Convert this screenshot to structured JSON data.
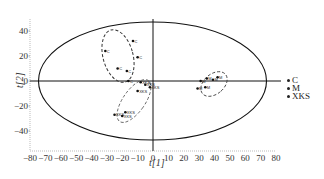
{
  "chart_data": {
    "type": "scatter",
    "title": "",
    "xlabel": "t[1]",
    "ylabel": "t[2]",
    "xlim": [
      -80,
      80
    ],
    "ylim": [
      -50,
      50
    ],
    "x_ticks": [
      -80,
      -70,
      -60,
      -50,
      -40,
      -30,
      -20,
      -10,
      0,
      10,
      20,
      30,
      40,
      50,
      60,
      70,
      80
    ],
    "y_ticks": [
      40,
      20,
      0,
      -20,
      -40
    ],
    "grid": false,
    "legend_position": "right",
    "hotelling_ellipse": {
      "cx": 0,
      "cy": 0,
      "rx": 74,
      "ry": 47
    },
    "series": [
      {
        "name": "C",
        "label": "C",
        "points": [
          [
            -13,
            32
          ],
          [
            -31,
            24
          ],
          [
            -10,
            19
          ],
          [
            -23,
            10
          ],
          [
            -17,
            8
          ],
          [
            -16,
            0
          ]
        ]
      },
      {
        "name": "M",
        "label": "M",
        "points": [
          [
            42,
            3
          ],
          [
            35,
            2
          ],
          [
            39,
            1
          ],
          [
            31,
            0
          ],
          [
            34,
            -5
          ],
          [
            29,
            -6
          ]
        ]
      },
      {
        "name": "XKS",
        "label": "XKS",
        "points": [
          [
            -8,
            -1
          ],
          [
            -5,
            -3
          ],
          [
            -2,
            -5
          ],
          [
            -10,
            -8
          ],
          [
            -18,
            -25
          ],
          [
            -25,
            -27
          ],
          [
            -20,
            -28
          ]
        ]
      }
    ],
    "group_ellipses": [
      {
        "group": "C",
        "style": "dashed"
      },
      {
        "group": "M",
        "style": "dashed"
      },
      {
        "group": "XKS",
        "style": "dashed"
      }
    ]
  },
  "legend": {
    "items": [
      "C",
      "M",
      "XKS"
    ]
  },
  "axes": {
    "x_label": "t[1]",
    "y_label": "t[2]"
  }
}
